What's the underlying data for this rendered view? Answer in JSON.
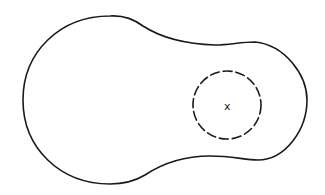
{
  "figure": {
    "background_color": "#ffffff",
    "stroke_color": "#1a1a1a",
    "outline": {
      "shape": "peanut",
      "style": "solid"
    },
    "region": {
      "shape": "circle",
      "style": "dashed",
      "center": [
        227,
        105
      ],
      "radius": 34
    },
    "marker": {
      "label": "x",
      "position": [
        228,
        106
      ]
    }
  }
}
